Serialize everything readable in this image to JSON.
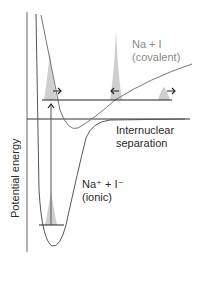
{
  "diagram": {
    "type": "potential-energy-curves",
    "y_axis_label": "Potential energy",
    "x_axis_label_line1": "Internuclear",
    "x_axis_label_line2": "separation",
    "covalent_label_line1": "Na + I",
    "covalent_label_line2": "(covalent)",
    "ionic_label_line1": "Na⁺ + I⁻",
    "ionic_label_line2": "(ionic)",
    "colors": {
      "axis": "#555555",
      "curve": "#666666",
      "ionic_curve": "#555555",
      "level_line": "#222222",
      "wavepacket_fill": "#cccccc",
      "covalent_text": "#8a8a8a",
      "ionic_text": "#2a2a2a"
    },
    "arrows": [
      {
        "direction": "right",
        "position": "left-packet"
      },
      {
        "direction": "left",
        "position": "middle-packet"
      },
      {
        "direction": "right",
        "position": "right-packet"
      },
      {
        "direction": "up",
        "position": "excitation"
      }
    ]
  }
}
